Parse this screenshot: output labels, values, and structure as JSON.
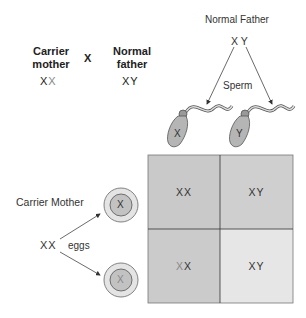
{
  "cross": {
    "mother_label": "Carrier mother",
    "mother_line1": "Carrier",
    "mother_line2": "mother",
    "mother_genotype_a": "X",
    "mother_genotype_b": "X",
    "cross_symbol": "X",
    "father_line1": "Normal",
    "father_line2": "father",
    "father_genotype": "XY"
  },
  "father": {
    "title": "Normal Father",
    "genotype": "X Y",
    "sperm_label": "Sperm",
    "sperm": [
      {
        "chromosome": "X"
      },
      {
        "chromosome": "Y"
      }
    ]
  },
  "mother": {
    "title": "Carrier Mother",
    "genotype_a": "X",
    "genotype_b": "X",
    "eggs_label": "eggs",
    "eggs": [
      {
        "chromosome": "X"
      },
      {
        "chromosome": "X"
      }
    ]
  },
  "punnett": {
    "cells": [
      {
        "a": "X",
        "b": "X",
        "color": "#c9c9c9"
      },
      {
        "a": "X",
        "b": "Y",
        "color": "#cfcfcf"
      },
      {
        "a": "X",
        "b": "X",
        "color": "#cbcbcb"
      },
      {
        "a": "X",
        "b": "Y",
        "color": "#e6e6e6"
      }
    ]
  },
  "colors": {
    "sperm_head": "#b5b5b5",
    "egg_outer": "#e4e4e4",
    "egg_inner": "#c2c2c2",
    "grid_line": "#444444",
    "faint_x": "#888888"
  }
}
